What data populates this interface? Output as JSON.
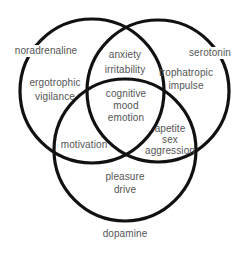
{
  "diagram": {
    "type": "venn",
    "stroke_color": "#111111",
    "text_color": "#555555",
    "background": "#ffffff",
    "sets": [
      {
        "id": "noradrenaline",
        "label": "noradrenaline",
        "cx": 92,
        "cy": 91,
        "r": 72
      },
      {
        "id": "serotonin",
        "label": "serotonin",
        "cx": 158,
        "cy": 91,
        "r": 71
      },
      {
        "id": "dopamine",
        "label": "dopamine",
        "cx": 125,
        "cy": 150,
        "r": 71
      }
    ],
    "regions": {
      "noradrenaline_only": [
        "ergotrophic",
        "vigilance"
      ],
      "serotonin_only": [
        "trophatropic",
        "impulse"
      ],
      "dopamine_only": [
        "pleasure",
        "drive"
      ],
      "noradrenaline_serotonin": [
        "anxiety",
        "irritability"
      ],
      "noradrenaline_dopamine": [
        "motivation"
      ],
      "serotonin_dopamine": [
        "apetite",
        "sex",
        "aggression"
      ],
      "all_three": [
        "cognitive",
        "mood",
        "emotion"
      ]
    }
  }
}
